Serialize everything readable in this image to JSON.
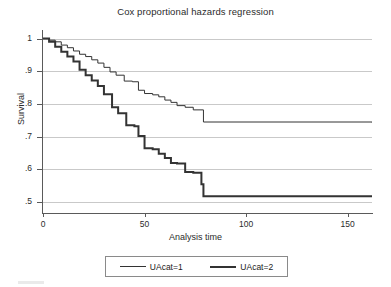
{
  "chart_data": {
    "type": "line",
    "title": "Cox proportional hazards regression",
    "xlabel": "Analysis time",
    "ylabel": "Survival",
    "xlim": [
      0,
      162
    ],
    "ylim": [
      0.47,
      1.02
    ],
    "xticks": [
      0,
      50,
      100,
      150
    ],
    "xtick_labels": [
      "0",
      "50",
      "100",
      "150"
    ],
    "yticks": [
      0.5,
      0.6,
      0.7,
      0.8,
      0.9,
      1.0
    ],
    "ytick_labels": [
      ".5",
      ".6",
      ".7",
      ".8",
      ".9",
      "1"
    ],
    "grid": true,
    "grid_axis": "y",
    "legend_position": "bottom",
    "step_type": "post",
    "series": [
      {
        "name": "UAcat=1",
        "color": "#333333",
        "line_width": 1,
        "x": [
          0,
          3,
          6,
          9,
          12,
          15,
          18,
          21,
          24,
          27,
          30,
          33,
          36,
          40,
          44,
          47,
          50,
          54,
          57,
          60,
          63,
          66,
          70,
          74,
          79,
          162
        ],
        "y": [
          1.0,
          0.995,
          0.99,
          0.98,
          0.972,
          0.962,
          0.952,
          0.945,
          0.935,
          0.925,
          0.912,
          0.898,
          0.888,
          0.87,
          0.868,
          0.842,
          0.832,
          0.828,
          0.822,
          0.812,
          0.805,
          0.795,
          0.79,
          0.782,
          0.745,
          0.744
        ]
      },
      {
        "name": "UAcat=2",
        "color": "#333333",
        "line_width": 2,
        "x": [
          0,
          3,
          6,
          9,
          12,
          15,
          18,
          21,
          24,
          27,
          30,
          34,
          37,
          41,
          45,
          47,
          50,
          54,
          57,
          60,
          63,
          66,
          70,
          74,
          78,
          79,
          162
        ],
        "y": [
          1.0,
          0.99,
          0.975,
          0.96,
          0.945,
          0.93,
          0.905,
          0.888,
          0.872,
          0.855,
          0.83,
          0.79,
          0.772,
          0.735,
          0.732,
          0.702,
          0.665,
          0.662,
          0.648,
          0.635,
          0.62,
          0.618,
          0.592,
          0.59,
          0.555,
          0.518,
          0.515
        ]
      }
    ]
  },
  "legend": {
    "entries": [
      {
        "label": "UAcat=1",
        "swatch": "thin-line-swatch"
      },
      {
        "label": "UAcat=2",
        "swatch": "thick-line-swatch"
      }
    ]
  }
}
